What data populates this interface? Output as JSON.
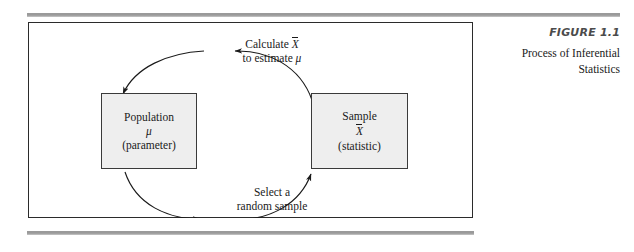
{
  "figure": {
    "caption_label": "FIGURE 1.1",
    "caption_description": "Process of Inferential Statistics",
    "caption_description_line1": "Process of Inferential",
    "caption_description_line2": "Statistics"
  },
  "diagram": {
    "type": "cycle-diagram",
    "nodes": [
      {
        "id": "population",
        "title": "Population",
        "symbol": "μ",
        "subtitle": "(parameter)"
      },
      {
        "id": "sample",
        "title": "Sample",
        "symbol": "X",
        "symbol_note": "X-bar",
        "subtitle": "(statistic)"
      }
    ],
    "arrows": [
      {
        "id": "sample-to-population",
        "from": "sample",
        "to": "population",
        "label_line1": "Calculate X̄",
        "label_line2": "to estimate μ",
        "label_line1_prefix": "Calculate ",
        "label_line1_symbol": "X",
        "label_line2_prefix": "to estimate ",
        "label_line2_symbol": "μ"
      },
      {
        "id": "population-to-sample",
        "from": "population",
        "to": "sample",
        "label_line1": "Select a",
        "label_line2": "random sample"
      }
    ]
  },
  "colors": {
    "box_fill": "#eeeeee",
    "box_border": "#3a3a3a",
    "frame_border": "#2b2b2b",
    "rule": "#9a9a9a",
    "caption_label": "#4b4b4b",
    "text": "#1a1a1a"
  }
}
